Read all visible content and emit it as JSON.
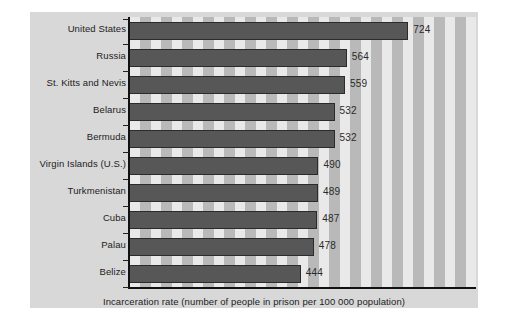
{
  "chart_data": {
    "type": "bar",
    "orientation": "horizontal",
    "title": "",
    "subtitle": "",
    "xlabel": "Incarceration rate (number of people in prison per 100 000 population)",
    "ylabel": "",
    "categories": [
      "United States",
      "Russia",
      "St. Kitts and Nevis",
      "Belarus",
      "Bermuda",
      "Virgin Islands (U.S.)",
      "Turkmenistan",
      "Cuba",
      "Palau",
      "Belize"
    ],
    "values": [
      724,
      564,
      559,
      532,
      532,
      490,
      489,
      487,
      478,
      444
    ],
    "value_labels": [
      "724",
      "564",
      "559",
      "532",
      "532",
      "490",
      "489",
      "487",
      "478",
      "444"
    ],
    "xlim": [
      0,
      900
    ],
    "grid": false,
    "legend": null,
    "colors": {
      "bar": "#575757",
      "bar_outline": "#2b2b2b",
      "panel_background": "#d8d8d8",
      "stripe_light": "#e9e9e9",
      "stripe_dark": "#b9b9b9",
      "axis": "#111111",
      "text": "#1c1c1c"
    }
  },
  "axis": {
    "caption": "Incarceration rate (number of people in prison per 100 000 population)"
  }
}
